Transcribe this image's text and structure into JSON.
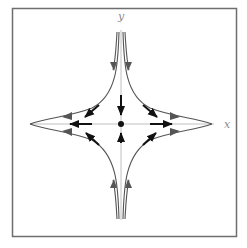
{
  "figure": {
    "type": "phase-portrait",
    "axes": {
      "x_label": "x",
      "y_label": "y"
    },
    "equilibrium": {
      "x": 0,
      "y": 0,
      "kind": "saddle"
    },
    "colors": {
      "frame": "#6e6e6e",
      "axis": "#b0b0b0",
      "trajectory": "#555555",
      "vector": "#111111",
      "label": "#8a8a8a"
    },
    "trajectories": [
      {
        "quadrant": "upper-left",
        "direction": "inward-along-y, outward-along-x"
      },
      {
        "quadrant": "upper-right",
        "direction": "inward-along-y, outward-along-x"
      },
      {
        "quadrant": "lower-left",
        "direction": "inward-along-y, outward-along-x"
      },
      {
        "quadrant": "lower-right",
        "direction": "inward-along-y, outward-along-x"
      }
    ],
    "vectors": [
      {
        "name": "stable-from-top",
        "direction": "down"
      },
      {
        "name": "stable-from-bottom",
        "direction": "up"
      },
      {
        "name": "unstable-to-right",
        "direction": "right"
      },
      {
        "name": "unstable-to-left",
        "direction": "left"
      },
      {
        "name": "diag-upper-right",
        "direction": "down-right"
      },
      {
        "name": "diag-upper-left",
        "direction": "down-left"
      },
      {
        "name": "diag-lower-right",
        "direction": "up-right"
      },
      {
        "name": "diag-lower-left",
        "direction": "up-left"
      }
    ]
  }
}
